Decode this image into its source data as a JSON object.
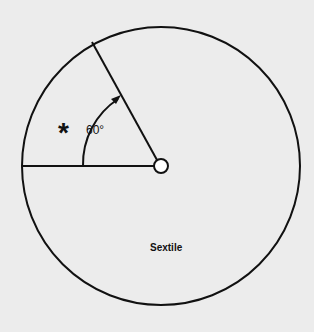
{
  "diagram": {
    "title": "Sextile",
    "angle_label": "60°",
    "angle_degrees": 60,
    "symbol": "*",
    "colors": {
      "background": "#ececec",
      "stroke": "#111111"
    }
  }
}
